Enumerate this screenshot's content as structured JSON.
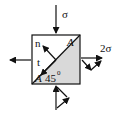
{
  "diagram": {
    "type": "stress-element",
    "colors": {
      "stroke": "#111111",
      "shade": "#d9d9d9",
      "background": "#ffffff"
    },
    "labels": {
      "sigma_top": "σ",
      "sigma_right": "2σ",
      "normal": "n",
      "tangent": "t",
      "plane_top": "A",
      "plane_bottom": "A",
      "angle": "45",
      "angle_unit": "0"
    }
  }
}
